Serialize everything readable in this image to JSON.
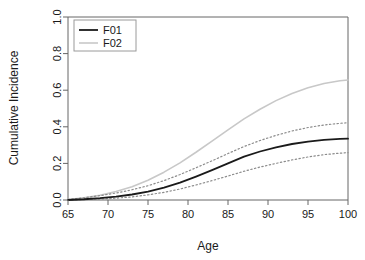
{
  "chart_data": {
    "type": "line",
    "title": "",
    "xlabel": "Age",
    "ylabel": "Cumulative Incidence",
    "xlim": [
      65,
      100
    ],
    "ylim": [
      0.0,
      1.0
    ],
    "grid": false,
    "legend_position": "top-left",
    "xticks": [
      "65",
      "70",
      "75",
      "80",
      "85",
      "90",
      "95",
      "100"
    ],
    "xtick_values": [
      65,
      70,
      75,
      80,
      85,
      90,
      95,
      100
    ],
    "yticks": [
      "0.0",
      "0.2",
      "0.4",
      "0.6",
      "0.8",
      "1.0"
    ],
    "ytick_values": [
      0.0,
      0.2,
      0.4,
      0.6,
      0.8,
      1.0
    ],
    "x": [
      65,
      67,
      69,
      71,
      73,
      75,
      77,
      79,
      81,
      83,
      85,
      87,
      89,
      91,
      93,
      95,
      97,
      99,
      100
    ],
    "series": [
      {
        "name": "F01",
        "style": "solid",
        "color": "#1a1a1a",
        "width": 1.8,
        "in_legend": true,
        "values": [
          0.0,
          0.004,
          0.01,
          0.018,
          0.03,
          0.046,
          0.068,
          0.095,
          0.128,
          0.163,
          0.2,
          0.237,
          0.265,
          0.288,
          0.306,
          0.319,
          0.329,
          0.334,
          0.335
        ]
      },
      {
        "name": "F01 upper CI",
        "style": "dotted",
        "color": "#8c8c8c",
        "width": 1.2,
        "in_legend": false,
        "values": [
          0.003,
          0.012,
          0.024,
          0.038,
          0.056,
          0.078,
          0.106,
          0.139,
          0.176,
          0.214,
          0.254,
          0.292,
          0.325,
          0.353,
          0.377,
          0.396,
          0.41,
          0.419,
          0.422
        ]
      },
      {
        "name": "F01 lower CI",
        "style": "dotted",
        "color": "#8c8c8c",
        "width": 1.2,
        "in_legend": false,
        "values": [
          0.0,
          0.002,
          0.005,
          0.01,
          0.017,
          0.028,
          0.042,
          0.06,
          0.082,
          0.106,
          0.131,
          0.157,
          0.18,
          0.2,
          0.219,
          0.235,
          0.248,
          0.256,
          0.259
        ]
      },
      {
        "name": "F02",
        "style": "solid",
        "color": "#c8c8c8",
        "width": 1.6,
        "in_legend": true,
        "values": [
          0.002,
          0.012,
          0.026,
          0.046,
          0.073,
          0.108,
          0.152,
          0.203,
          0.261,
          0.322,
          0.383,
          0.443,
          0.496,
          0.543,
          0.582,
          0.613,
          0.637,
          0.652,
          0.656
        ]
      }
    ],
    "legend": [
      {
        "label": "F01",
        "color": "#1a1a1a",
        "style": "solid"
      },
      {
        "label": "F02",
        "color": "#c8c8c8",
        "style": "solid"
      }
    ]
  }
}
